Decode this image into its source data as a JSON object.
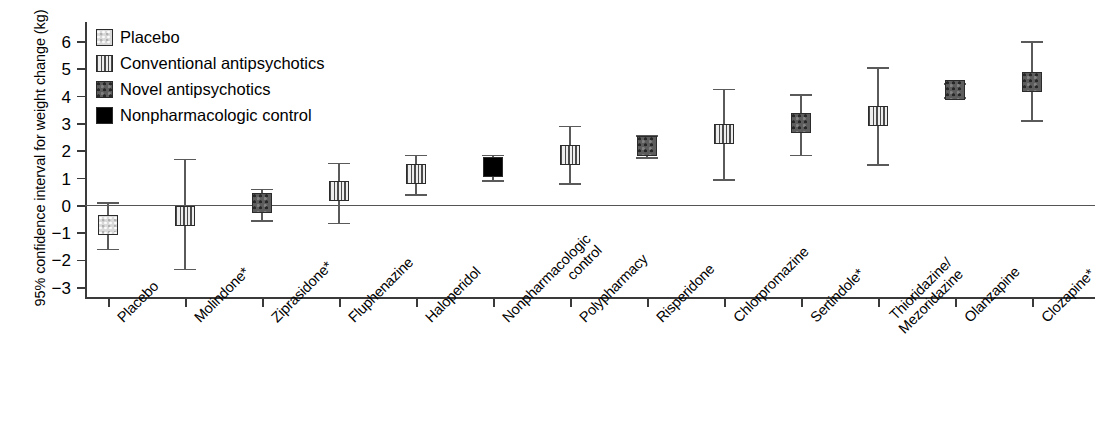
{
  "chart_data": {
    "type": "scatter",
    "title": "",
    "subtitle": "",
    "xlabel": "",
    "ylabel": "95% confidence interval for weight change (kg)",
    "ylim": [
      -3.4,
      6.7
    ],
    "yticks": [
      6,
      5,
      4,
      3,
      2,
      1,
      0,
      -1,
      -2,
      -3
    ],
    "ytick_labels": [
      "6",
      "5",
      "4",
      "3",
      "2",
      "1",
      "0",
      "−1",
      "−2",
      "−3"
    ],
    "grid": false,
    "zero_reference_line": 0,
    "legend_position": "top-left",
    "legend": [
      {
        "key": "placebo",
        "label": "Placebo",
        "fill_class": "fill-placebo",
        "color": "#d9d9d9"
      },
      {
        "key": "conventional",
        "label": "Conventional antipsychotics",
        "fill_class": "fill-conventional",
        "color": "#e8e8e8"
      },
      {
        "key": "novel",
        "label": "Novel antipsychotics",
        "fill_class": "fill-novel",
        "color": "#5d5d5d"
      },
      {
        "key": "nonpharm",
        "label": "Nonpharmacologic control",
        "fill_class": "fill-nonpharm",
        "color": "#000000"
      }
    ],
    "categories": [
      "Placebo",
      "Molindone*",
      "Ziprasidone*",
      "Fluphenazine",
      "Haloperidol",
      "Nonpharmacologic\ncontrol",
      "Polypharmacy",
      "Risperidone",
      "Chlorpromazine",
      "Sertindole*",
      "Thioridazine/\nMezoridazine",
      "Olanzapine",
      "Clozapine*"
    ],
    "points": [
      {
        "category": "Placebo",
        "group": "placebo",
        "value": -0.74,
        "ci_low": -1.6,
        "ci_high": 0.1
      },
      {
        "category": "Molindone*",
        "group": "conventional",
        "value": -0.39,
        "ci_low": -2.33,
        "ci_high": 1.7
      },
      {
        "category": "Ziprasidone*",
        "group": "novel",
        "value": 0.08,
        "ci_low": -0.55,
        "ci_high": 0.6
      },
      {
        "category": "Fluphenazine",
        "group": "conventional",
        "value": 0.5,
        "ci_low": -0.65,
        "ci_high": 1.55
      },
      {
        "category": "Haloperidol",
        "group": "conventional",
        "value": 1.15,
        "ci_low": 0.4,
        "ci_high": 1.85
      },
      {
        "category": "Nonpharmacologic control",
        "group": "nonpharm",
        "value": 1.4,
        "ci_low": 0.9,
        "ci_high": 1.85
      },
      {
        "category": "Polypharmacy",
        "group": "conventional",
        "value": 1.85,
        "ci_low": 0.8,
        "ci_high": 2.9
      },
      {
        "category": "Risperidone",
        "group": "novel",
        "value": 2.15,
        "ci_low": 1.75,
        "ci_high": 2.55
      },
      {
        "category": "Chlorpromazine",
        "group": "conventional",
        "value": 2.6,
        "ci_low": 0.95,
        "ci_high": 4.25
      },
      {
        "category": "Sertindole*",
        "group": "novel",
        "value": 3.0,
        "ci_low": 1.85,
        "ci_high": 4.05
      },
      {
        "category": "Thioridazine/Mezoridazine",
        "group": "conventional",
        "value": 3.25,
        "ci_low": 1.5,
        "ci_high": 5.05
      },
      {
        "category": "Olanzapine",
        "group": "novel",
        "value": 4.2,
        "ci_low": 3.95,
        "ci_high": 4.45
      },
      {
        "category": "Clozapine*",
        "group": "novel",
        "value": 4.5,
        "ci_low": 3.1,
        "ci_high": 6.0
      }
    ]
  }
}
